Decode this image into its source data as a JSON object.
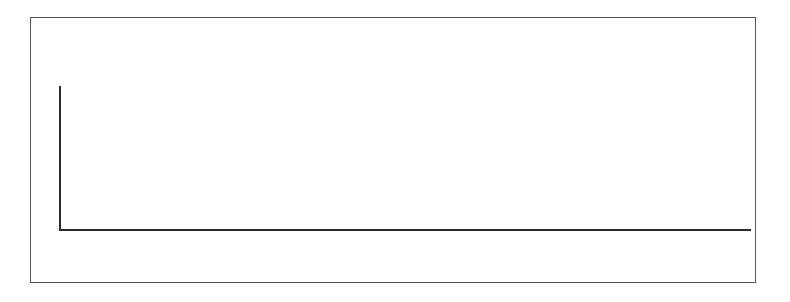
{
  "chart_data": {
    "type": "bar",
    "xlabel": "",
    "ylabel": "",
    "ylim": [
      0,
      5
    ],
    "y_ticks": [
      0,
      1,
      2,
      3,
      4,
      5
    ],
    "grid": false,
    "legend": null,
    "categories": [
      "Jan",
      "Feb",
      "Mar",
      "Apr",
      "May",
      "Jun",
      "Jul",
      "Aug",
      "Sep",
      "Oct",
      "Nov",
      "Dec"
    ],
    "bin_note": "quarter-month bins; counts of arrival records per bin",
    "bins": [
      {
        "label": "Jan 1",
        "value": 0
      },
      {
        "label": "Jan 2",
        "value": 0
      },
      {
        "label": "Jan 3",
        "value": 0
      },
      {
        "label": "Jan 4",
        "value": 0
      },
      {
        "label": "Feb 1",
        "value": 0
      },
      {
        "label": "Feb 2",
        "value": 0
      },
      {
        "label": "Feb 3",
        "value": 0
      },
      {
        "label": "Feb 4",
        "value": 0
      },
      {
        "label": "Mar 1",
        "value": 0
      },
      {
        "label": "Mar 2",
        "value": 0
      },
      {
        "label": "Mar 3",
        "value": 0
      },
      {
        "label": "Mar 4",
        "value": 0
      },
      {
        "label": "Apr 1",
        "value": 1
      },
      {
        "label": "Apr 2",
        "value": 1
      },
      {
        "label": "Apr 3",
        "value": 2
      },
      {
        "label": "Apr 4",
        "value": 0
      },
      {
        "label": "May 1",
        "value": 4
      },
      {
        "label": "May 2",
        "value": 1
      },
      {
        "label": "May 3",
        "value": 2
      },
      {
        "label": "May 4",
        "value": 1
      },
      {
        "label": "Jun 1",
        "value": 1
      },
      {
        "label": "Jun 2",
        "value": 0
      },
      {
        "label": "Jun 3",
        "value": 0
      },
      {
        "label": "Jun 4",
        "value": 0
      },
      {
        "label": "Jul 1",
        "value": 0
      },
      {
        "label": "Jul 2",
        "value": 0
      },
      {
        "label": "Jul 3",
        "value": 0
      },
      {
        "label": "Jul 4",
        "value": 0
      },
      {
        "label": "Aug 1",
        "value": 0
      },
      {
        "label": "Aug 2",
        "value": 0
      },
      {
        "label": "Aug 3",
        "value": 0
      },
      {
        "label": "Aug 4",
        "value": 0
      },
      {
        "label": "Sep 1",
        "value": 0
      },
      {
        "label": "Sep 2",
        "value": 0
      },
      {
        "label": "Sep 3",
        "value": 0
      },
      {
        "label": "Sep 4",
        "value": 0
      },
      {
        "label": "Oct 1",
        "value": 0
      },
      {
        "label": "Oct 2",
        "value": 0
      },
      {
        "label": "Oct 3",
        "value": 0
      },
      {
        "label": "Oct 4",
        "value": 0
      },
      {
        "label": "Nov 1",
        "value": 0
      },
      {
        "label": "Nov 2",
        "value": 0
      },
      {
        "label": "Nov 3",
        "value": 0
      },
      {
        "label": "Nov 4",
        "value": 0
      },
      {
        "label": "Dec 1",
        "value": 0
      },
      {
        "label": "Dec 2",
        "value": 0
      },
      {
        "label": "Dec 3",
        "value": 0
      },
      {
        "label": "Dec 4",
        "value": 0
      }
    ],
    "colors": {
      "bar": "#17181a",
      "axis": "#2b2c30",
      "text": "#3a3b40",
      "frame": "#55565a",
      "background": "#ffffff"
    }
  },
  "layout": {
    "axis_left_px": 59,
    "axis_right_px": 751,
    "axis_baseline_px": 229,
    "axis_top_px": 86,
    "bins_per_month": 4
  }
}
